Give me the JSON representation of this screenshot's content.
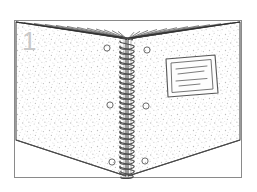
{
  "illustration": {
    "title": "Spiral-bound book opened flat, step 1",
    "step_number": "1",
    "style": "line-art stipple engraving",
    "canvas": {
      "width": 257,
      "height": 192
    },
    "colors": {
      "background": "#ffffff",
      "outline": "#3a3a3a",
      "frame": "#8a8a8a",
      "stipple": "#b9b9b9",
      "spiral": "#4a4a4a",
      "label_border": "#555555",
      "label_text_line": "#666666",
      "step_number": "#c9c9c9",
      "page_fan": "#2e2e2e"
    },
    "frame": {
      "name": "outer-border",
      "x": 14,
      "y": 20,
      "width": 228,
      "height": 158,
      "stroke": "#8a8a8a",
      "stroke_width": 1
    },
    "book": {
      "name": "spiral-bound-book",
      "left_cover": {
        "label": "Left cover",
        "points": "16,22 126,38 126,176 16,140"
      },
      "right_cover": {
        "label": "Right cover",
        "points": "128,38 240,22 240,140 128,176"
      },
      "top_edge_left": "16,22 126,38",
      "top_edge_right": "128,38 240,22",
      "bottom_edge_left": "16,140 126,176",
      "bottom_edge_right": "128,176 240,140",
      "texture": "stipple"
    },
    "spine": {
      "name": "spiral-binding",
      "x_center": 127,
      "top_y": 38,
      "bottom_y": 178,
      "coil_count": 26,
      "coil_width": 15,
      "stroke": "#4a4a4a"
    },
    "page_fan": {
      "name": "page-edges-fan",
      "description": "Fan of page edge lines converging at spine top",
      "apex": {
        "x": 127,
        "y": 39
      },
      "line_count": 22,
      "left_span_x": [
        16,
        122
      ],
      "right_span_x": [
        132,
        240
      ],
      "left_span_y": [
        22,
        34
      ],
      "right_span_y": [
        34,
        22
      ]
    },
    "punch_holes": {
      "name": "punch-holes",
      "radius": 3.1,
      "positions": [
        {
          "cx": 107,
          "cy": 48
        },
        {
          "cx": 147,
          "cy": 50
        },
        {
          "cx": 110,
          "cy": 105
        },
        {
          "cx": 146,
          "cy": 106
        },
        {
          "cx": 112,
          "cy": 162
        },
        {
          "cx": 145,
          "cy": 161
        }
      ]
    },
    "label_card": {
      "name": "cover-label-card",
      "description": "Rectangular label affixed to the right cover with writing lines",
      "outer_points": "166,59 215,55 218,93 168,97",
      "inner_points": "171,63 211,59.5 213,89 172,92.5",
      "text_lines": [
        {
          "x1": 176,
          "y1": 69,
          "x2": 207,
          "y2": 66
        },
        {
          "x1": 178,
          "y1": 74,
          "x2": 204,
          "y2": 71
        },
        {
          "x1": 176,
          "y1": 81,
          "x2": 207,
          "y2": 78.5
        },
        {
          "x1": 179,
          "y1": 86,
          "x2": 200,
          "y2": 84
        }
      ]
    }
  }
}
